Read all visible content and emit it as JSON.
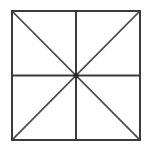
{
  "figure": {
    "name": "square-with-diagonals-and-midlines",
    "background_color": "#ffffff",
    "canvas": {
      "width": 152,
      "height": 154
    },
    "square": {
      "x": 12,
      "y": 11,
      "width": 128,
      "height": 129,
      "stroke_color": "#3a3a3a",
      "stroke_width": 2,
      "fill": "none"
    },
    "center_point": {
      "x": 76,
      "y": 75.5
    },
    "lines": [
      {
        "name": "vertical-midline",
        "x1": 76,
        "y1": 11,
        "x2": 76,
        "y2": 140,
        "stroke_color": "#3a3a3a",
        "stroke_width": 2
      },
      {
        "name": "horizontal-midline",
        "x1": 12,
        "y1": 75.5,
        "x2": 140,
        "y2": 75.5,
        "stroke_color": "#3a3a3a",
        "stroke_width": 2
      },
      {
        "name": "diagonal-top-left-to-bottom-right",
        "x1": 12,
        "y1": 11,
        "x2": 140,
        "y2": 140,
        "stroke_color": "#4a4a4a",
        "stroke_width": 1.7
      },
      {
        "name": "diagonal-top-right-to-bottom-left",
        "x1": 140,
        "y1": 11,
        "x2": 12,
        "y2": 140,
        "stroke_color": "#4a4a4a",
        "stroke_width": 1.7
      }
    ],
    "center_hub": {
      "x": 76,
      "y": 75.5,
      "radius": 2.6,
      "color": "#2a2a2a"
    },
    "triangle_count": 8
  }
}
